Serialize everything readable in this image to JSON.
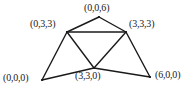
{
  "figure": {
    "type": "geometric-diagram",
    "background_color": "#ffffff",
    "stroke_color": "#1a1a1a",
    "label_color": "#1a1a1a",
    "width": 194,
    "height": 91
  },
  "vertices": [
    {
      "id": "top",
      "label": "(0,0,6)",
      "x": 99,
      "y": 17
    },
    {
      "id": "upper-left",
      "label": "(0,3,3)",
      "x": 67,
      "y": 32
    },
    {
      "id": "upper-right",
      "label": "(3,3,3)",
      "x": 126,
      "y": 32
    },
    {
      "id": "bottom-left",
      "label": "(0,0,0)",
      "x": 42,
      "y": 80
    },
    {
      "id": "bottom-mid",
      "label": "(3,3,0)",
      "x": 94,
      "y": 68
    },
    {
      "id": "bottom-right",
      "label": "(6,0,0)",
      "x": 150,
      "y": 77
    }
  ],
  "edges": [
    {
      "from": "top",
      "to": "upper-left"
    },
    {
      "from": "top",
      "to": "upper-right"
    },
    {
      "from": "upper-left",
      "to": "upper-right"
    },
    {
      "from": "upper-left",
      "to": "bottom-left"
    },
    {
      "from": "upper-left",
      "to": "bottom-mid"
    },
    {
      "from": "upper-right",
      "to": "bottom-mid"
    },
    {
      "from": "upper-right",
      "to": "bottom-right"
    },
    {
      "from": "bottom-left",
      "to": "bottom-mid"
    },
    {
      "from": "bottom-mid",
      "to": "bottom-right"
    }
  ]
}
